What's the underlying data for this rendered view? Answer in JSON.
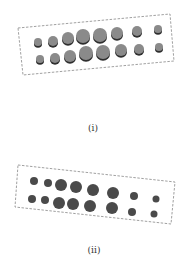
{
  "figure": {
    "panels": [
      {
        "label": "(i)",
        "style": "3d-cylinders",
        "box": [
          [
            18,
            28
          ],
          [
            170,
            14
          ],
          [
            174,
            61
          ],
          [
            23,
            75
          ]
        ],
        "rows": [
          [
            {
              "x": 38,
              "y": 42,
              "r": 4
            },
            {
              "x": 53,
              "y": 41,
              "r": 5
            },
            {
              "x": 68,
              "y": 38,
              "r": 6
            },
            {
              "x": 83,
              "y": 36,
              "r": 7
            },
            {
              "x": 100,
              "y": 35,
              "r": 7
            },
            {
              "x": 117,
              "y": 33,
              "r": 6
            },
            {
              "x": 137,
              "y": 31,
              "r": 5
            },
            {
              "x": 158,
              "y": 29,
              "r": 4
            }
          ],
          [
            {
              "x": 40,
              "y": 59,
              "r": 4
            },
            {
              "x": 55,
              "y": 58,
              "r": 5
            },
            {
              "x": 70,
              "y": 56,
              "r": 6
            },
            {
              "x": 86,
              "y": 53,
              "r": 7
            },
            {
              "x": 103,
              "y": 52,
              "r": 7
            },
            {
              "x": 121,
              "y": 50,
              "r": 6
            },
            {
              "x": 139,
              "y": 49,
              "r": 5
            },
            {
              "x": 159,
              "y": 47,
              "r": 4
            }
          ]
        ]
      },
      {
        "label": "(ii)",
        "style": "flat-discs",
        "box": [
          [
            18,
            165
          ],
          [
            175,
            182
          ],
          [
            171,
            224
          ],
          [
            15,
            207
          ]
        ],
        "rows": [
          [
            {
              "x": 34,
              "y": 181,
              "r": 4
            },
            {
              "x": 48,
              "y": 183,
              "r": 4
            },
            {
              "x": 61,
              "y": 185,
              "r": 6
            },
            {
              "x": 76,
              "y": 187,
              "r": 6
            },
            {
              "x": 93,
              "y": 190,
              "r": 6
            },
            {
              "x": 113,
              "y": 193,
              "r": 6
            },
            {
              "x": 134,
              "y": 196,
              "r": 4
            },
            {
              "x": 156,
              "y": 199,
              "r": 3.5
            }
          ],
          [
            {
              "x": 32,
              "y": 199,
              "r": 4
            },
            {
              "x": 45,
              "y": 200,
              "r": 4
            },
            {
              "x": 59,
              "y": 203,
              "r": 6
            },
            {
              "x": 73,
              "y": 204,
              "r": 6
            },
            {
              "x": 90,
              "y": 206,
              "r": 6
            },
            {
              "x": 112,
              "y": 208,
              "r": 6
            },
            {
              "x": 132,
              "y": 212,
              "r": 4
            },
            {
              "x": 154,
              "y": 214,
              "r": 3.5
            }
          ]
        ]
      }
    ],
    "colors": {
      "cylinder_top": "#8a8a8a",
      "cylinder_side": "#2e2e2e",
      "disc": "#4a4a4a",
      "box_stroke": "#888888",
      "label": "#333333"
    }
  }
}
